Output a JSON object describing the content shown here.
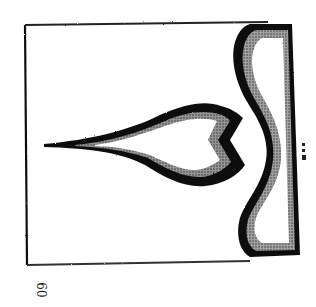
{
  "figure": {
    "stroke_color": "#111111",
    "background_color": "#ffffff"
  },
  "page": {
    "number": "60"
  }
}
